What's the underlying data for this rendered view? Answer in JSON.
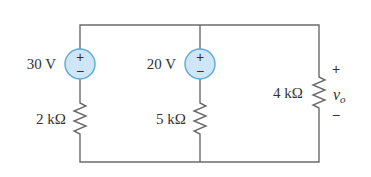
{
  "diagram": {
    "type": "circuit",
    "sources": [
      {
        "id": "source-left",
        "label": "30 V",
        "plus": "+",
        "minus": "−"
      },
      {
        "id": "source-middle",
        "label": "20 V",
        "plus": "+",
        "minus": "−"
      }
    ],
    "resistors": [
      {
        "id": "resistor-left",
        "label": "2 kΩ"
      },
      {
        "id": "resistor-middle",
        "label": "5 kΩ"
      },
      {
        "id": "resistor-right",
        "label": "4 kΩ"
      }
    ],
    "output": {
      "plus": "+",
      "minus": "−",
      "label": "v",
      "subscript": "o"
    },
    "colors": {
      "wire": "#6b6b6b",
      "source_fill": "#cfe6f6",
      "source_stroke": "#5aa8d8",
      "text": "#333333"
    }
  }
}
